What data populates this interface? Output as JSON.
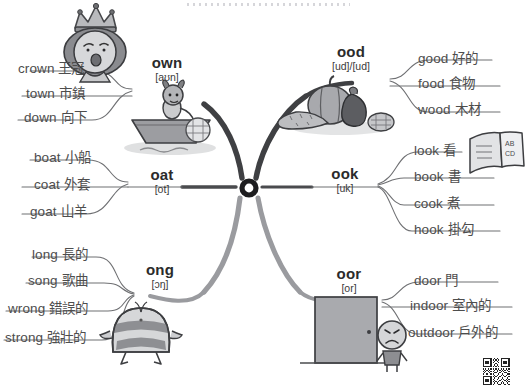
{
  "page": {
    "center_node": "O",
    "background_color": "#ffffff",
    "line_color": "#6f7073",
    "text_color": "#4d4d4d"
  },
  "branches": [
    {
      "id": "own",
      "key": "own",
      "phonetic": "[aʊn]",
      "side": "left",
      "illustration": "queen-crown-illustration",
      "words": [
        {
          "en": "crown",
          "zh": "王冠"
        },
        {
          "en": "town",
          "zh": "市鎮"
        },
        {
          "en": "down",
          "zh": "向下"
        }
      ]
    },
    {
      "id": "oat",
      "key": "oat",
      "phonetic": "[ot]",
      "side": "left",
      "illustration": "goat-in-boat-illustration",
      "words": [
        {
          "en": "boat",
          "zh": "小船"
        },
        {
          "en": "coat",
          "zh": "外套"
        },
        {
          "en": "goat",
          "zh": "山羊"
        }
      ]
    },
    {
      "id": "ong",
      "key": "ong",
      "phonetic": "[ɔŋ]",
      "side": "left",
      "illustration": "strong-bee-illustration",
      "words": [
        {
          "en": "long",
          "zh": "長的"
        },
        {
          "en": "song",
          "zh": "歌曲"
        },
        {
          "en": "wrong",
          "zh": "錯誤的"
        },
        {
          "en": "strong",
          "zh": "強壯的"
        }
      ]
    },
    {
      "id": "ood",
      "key": "ood",
      "phonetic": "[ud]/[ud]",
      "side": "right",
      "illustration": "vegetables-food-illustration",
      "words": [
        {
          "en": "good",
          "zh": "好的"
        },
        {
          "en": "food",
          "zh": "食物"
        },
        {
          "en": "wood",
          "zh": "木材"
        }
      ]
    },
    {
      "id": "ook",
      "key": "ook",
      "phonetic": "[uk]",
      "side": "right",
      "illustration": "open-book-illustration",
      "illustration_text": "AB CD",
      "words": [
        {
          "en": "look",
          "zh": "看"
        },
        {
          "en": "book",
          "zh": "書"
        },
        {
          "en": "cook",
          "zh": "煮"
        },
        {
          "en": "hook",
          "zh": "掛勾"
        }
      ]
    },
    {
      "id": "oor",
      "key": "oor",
      "phonetic": "[or]",
      "side": "right",
      "illustration": "door-with-sad-kid-illustration",
      "words": [
        {
          "en": "door",
          "zh": "門"
        },
        {
          "en": "indoor",
          "zh": "室內的"
        },
        {
          "en": "outdoor",
          "zh": "戶外的"
        }
      ]
    }
  ],
  "decor": {
    "top_dotted_rule": "dotted-separator",
    "qr_code": "qr-code"
  }
}
